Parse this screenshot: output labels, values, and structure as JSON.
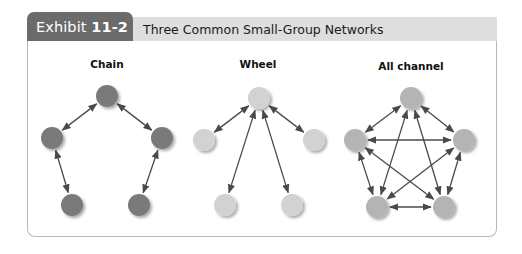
{
  "header": {
    "exhibit_prefix": "Exhibit ",
    "exhibit_number": "11-2",
    "title": "Three Common Small-Group Networks"
  },
  "colors": {
    "tab_bg": "#6b6b6b",
    "title_band_bg": "#dedede",
    "chain_node": "#7a7a7a",
    "wheel_node": "#d2d2d2",
    "all_channel_node": "#b4b4b4",
    "arrow": "#4a4a4a"
  },
  "networks": [
    {
      "id": "chain",
      "label": "Chain",
      "label_pos": [
        107,
        68
      ],
      "node_color": "#7a7a7a",
      "nodes": [
        [
          107,
          96
        ],
        [
          52,
          138
        ],
        [
          162,
          138
        ],
        [
          72,
          205
        ],
        [
          139,
          205
        ]
      ],
      "edges": [
        [
          0,
          1
        ],
        [
          0,
          2
        ],
        [
          1,
          3
        ],
        [
          2,
          4
        ]
      ]
    },
    {
      "id": "wheel",
      "label": "Wheel",
      "label_pos": [
        258,
        68
      ],
      "node_color": "#d2d2d2",
      "nodes": [
        [
          259,
          98
        ],
        [
          204,
          140
        ],
        [
          314,
          140
        ],
        [
          225,
          205
        ],
        [
          292,
          205
        ]
      ],
      "edges": [
        [
          0,
          1
        ],
        [
          0,
          2
        ],
        [
          0,
          3
        ],
        [
          0,
          4
        ]
      ]
    },
    {
      "id": "all-channel",
      "label": "All channel",
      "label_pos": [
        411,
        70
      ],
      "node_color": "#b4b4b4",
      "nodes": [
        [
          411,
          98
        ],
        [
          355,
          140
        ],
        [
          464,
          140
        ],
        [
          377,
          207
        ],
        [
          444,
          207
        ]
      ],
      "edges": [
        [
          0,
          1
        ],
        [
          0,
          2
        ],
        [
          0,
          3
        ],
        [
          0,
          4
        ],
        [
          1,
          2
        ],
        [
          1,
          3
        ],
        [
          1,
          4
        ],
        [
          2,
          3
        ],
        [
          2,
          4
        ],
        [
          3,
          4
        ]
      ]
    }
  ]
}
